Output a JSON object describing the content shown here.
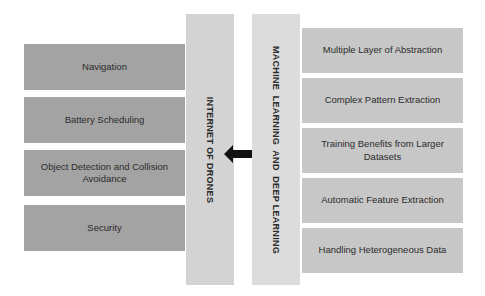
{
  "left_column": {
    "items": [
      {
        "label": "Navigation"
      },
      {
        "label": "Battery Scheduling"
      },
      {
        "label": "Object Detection and Collision Avoidance"
      },
      {
        "label": "Security"
      }
    ]
  },
  "center": {
    "left_pillar_label": "INTERNET OF DRONES",
    "right_pillar_label": "MACHINE  LEARNING  AND  DEEP LEARNING",
    "connector_icon": "double-headed-arrow"
  },
  "right_column": {
    "items": [
      {
        "label": "Multiple Layer of Abstraction"
      },
      {
        "label": "Complex Pattern Extraction"
      },
      {
        "label": "Training Benefits from Larger Datasets"
      },
      {
        "label": "Automatic Feature Extraction"
      },
      {
        "label": "Handling Heterogeneous Data"
      }
    ]
  },
  "colors": {
    "left_box": "#a3a3a3",
    "right_box": "#c7c7c7",
    "pillar": "#d3d3d3",
    "arrow": "#111111"
  }
}
